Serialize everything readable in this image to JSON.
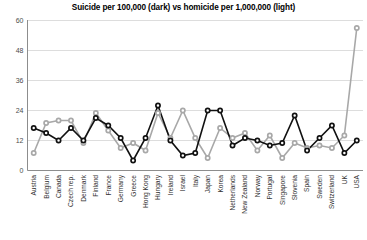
{
  "chart_data": {
    "type": "line",
    "title": "Suicide per 100,000 (dark) vs homicide per 1,000,000 (light)",
    "xlabel": "",
    "ylabel": "",
    "ylim": [
      0,
      60
    ],
    "yticks": [
      0,
      12,
      24,
      36,
      48,
      60
    ],
    "grid": true,
    "legend_position": "none",
    "legend_note_dark": "dark",
    "legend_note_light": "light",
    "categories": [
      "Austria",
      "Belgium",
      "Canada",
      "Czech rep.",
      "Denmark",
      "Finland",
      "France",
      "Germany",
      "Greece",
      "Hong Kong",
      "Hungary",
      "Ireland",
      "Israel",
      "Italy",
      "Japan",
      "Korea",
      "Netherlands",
      "New Zealand",
      "Norway",
      "Portugal",
      "Singapore",
      "Slovenia",
      "Spain",
      "Sweden",
      "Switzerland",
      "UK",
      "USA"
    ],
    "series": [
      {
        "name": "Suicide per 100,000",
        "style": "dark",
        "color": "#111111",
        "values": [
          17,
          15,
          12,
          17,
          12,
          21,
          18,
          13,
          4,
          13,
          26,
          12,
          6,
          7,
          24,
          24,
          10,
          13,
          12,
          10,
          11,
          22,
          8,
          13,
          18,
          7,
          12
        ]
      },
      {
        "name": "Homicide per 1,000,000",
        "style": "light",
        "color": "#a8a8a8",
        "values": [
          7,
          19,
          20,
          20,
          11,
          23,
          16,
          9,
          11,
          8,
          23,
          13,
          24,
          13,
          5,
          17,
          13,
          15,
          8,
          14,
          5,
          11,
          9,
          10,
          9,
          14,
          57
        ]
      }
    ]
  }
}
